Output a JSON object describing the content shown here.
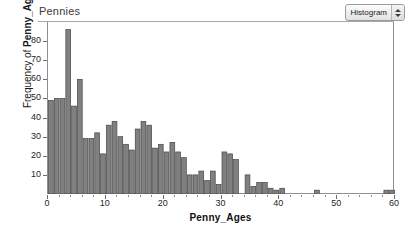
{
  "window": {
    "doc_title": "Pennies"
  },
  "toolbar": {
    "plot_type_label": "Histogram",
    "up_arrow_icon": "triangle-up-icon",
    "down_arrow_icon": "triangle-down-icon"
  },
  "chart_data": {
    "type": "bar",
    "title": "Pennies",
    "xlabel": "Penny_Ages",
    "ylabel_prefix": "Frequency of ",
    "ylabel_variable": "Penny_Ages",
    "ylabel": "Frequency of Penny_Ages",
    "xlim": [
      0,
      60
    ],
    "ylim": [
      0,
      90
    ],
    "grid": false,
    "bin_width": 1,
    "bar_color": "#808080",
    "bar_edge_color": "#454545",
    "x_ticks": [
      0,
      10,
      20,
      30,
      40,
      50,
      60
    ],
    "y_ticks": [
      10,
      20,
      30,
      40,
      50,
      60,
      70,
      80
    ],
    "categories": [
      "0",
      "1",
      "2",
      "3",
      "4",
      "5",
      "6",
      "7",
      "8",
      "9",
      "10",
      "11",
      "12",
      "13",
      "14",
      "15",
      "16",
      "17",
      "18",
      "19",
      "20",
      "21",
      "22",
      "23",
      "24",
      "25",
      "26",
      "27",
      "28",
      "29",
      "30",
      "31",
      "32",
      "33",
      "34",
      "35",
      "36",
      "37",
      "38",
      "39",
      "40",
      "41",
      "42",
      "43",
      "44",
      "45",
      "46",
      "47",
      "48",
      "49",
      "50",
      "51",
      "52",
      "53",
      "54",
      "55",
      "56",
      "57",
      "58",
      "59"
    ],
    "values": [
      49,
      50,
      50,
      86,
      46,
      60,
      29,
      29,
      32,
      21,
      36,
      38,
      30,
      26,
      23,
      34,
      38,
      36,
      24,
      26,
      22,
      27,
      22,
      19,
      10,
      10,
      12,
      7,
      12,
      5,
      22,
      21,
      18,
      0,
      10,
      4,
      6,
      6,
      3,
      2,
      3,
      0,
      0,
      0,
      0,
      0,
      2,
      0,
      0,
      0,
      0,
      0,
      0,
      0,
      0,
      0,
      0,
      0,
      2,
      2
    ]
  }
}
